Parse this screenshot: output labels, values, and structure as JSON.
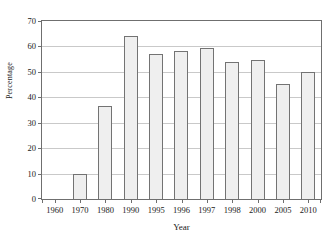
{
  "figure": {
    "cut_caption": "",
    "background_color": "#ffffff"
  },
  "style": {
    "bar_fill": "#efefef",
    "bar_border": "#737373",
    "axis_color": "#6f6f6f",
    "grid_color": "#c9c9c9",
    "text_color": "#1a1a1a"
  },
  "chart_data": {
    "type": "bar",
    "title": "",
    "xlabel": "Year",
    "ylabel": "Percentage",
    "categories": [
      "1960",
      "1970",
      "1980",
      "1990",
      "1995",
      "1996",
      "1997",
      "1998",
      "2000",
      "2005",
      "2010"
    ],
    "values": [
      0,
      10,
      36.5,
      64.2,
      57,
      58.3,
      59.5,
      54,
      54.8,
      45.2,
      50
    ],
    "ylim": [
      0,
      70
    ],
    "ytick_values": [
      0,
      10,
      20,
      30,
      40,
      50,
      60,
      70
    ],
    "ytick_labels": [
      "0",
      "10",
      "20",
      "30",
      "40",
      "50",
      "60",
      "70"
    ],
    "grid": "horizontal",
    "legend": "none"
  }
}
